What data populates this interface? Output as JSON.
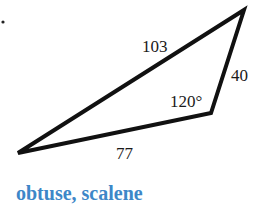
{
  "diagram": {
    "type": "triangle",
    "vertices": {
      "left": [
        18,
        153
      ],
      "top_right": [
        244,
        10
      ],
      "obtuse": [
        211,
        113
      ]
    },
    "sides": {
      "long": "103",
      "right": "40",
      "bottom": "77"
    },
    "angle": "120°",
    "bullet": ".",
    "caption": "obtuse, scalene",
    "colors": {
      "stroke": "#111111",
      "caption": "#3d87c8"
    }
  }
}
